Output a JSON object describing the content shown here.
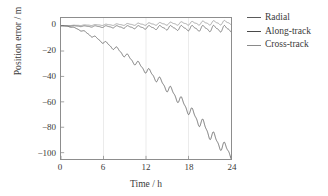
{
  "chart_data": {
    "type": "line",
    "title": "",
    "xlabel": "Time / h",
    "ylabel": "Position error / m",
    "xlim": [
      0,
      24
    ],
    "ylim": [
      -105,
      6
    ],
    "xticks": [
      0,
      6,
      12,
      18,
      24
    ],
    "yticks": [
      0,
      -20,
      -40,
      -60,
      -80,
      -100
    ],
    "xtick_labels": [
      "0",
      "6",
      "12",
      "18",
      "24"
    ],
    "ytick_labels": [
      "0",
      "−20",
      "−40",
      "−60",
      "−80",
      "−100"
    ],
    "grid": "vertical-faint",
    "legend_position": "right-outside",
    "series": [
      {
        "name": "Radial",
        "color": "#5a5a5a",
        "description": "near-zero oscillation with slowly growing amplitude, period about 1.5 h, amplitude growing from 0 to about 3 m",
        "x": [
          0,
          1,
          2,
          3,
          4,
          5,
          6,
          7,
          8,
          9,
          10,
          11,
          12,
          13,
          14,
          15,
          16,
          17,
          18,
          19,
          20,
          21,
          22,
          23,
          24
        ],
        "values": [
          0,
          -0.2,
          -0.3,
          -0.5,
          -0.6,
          -0.7,
          -0.8,
          -0.9,
          -1.0,
          -1.1,
          -1.2,
          -1.3,
          -1.4,
          -1.5,
          -1.6,
          -1.7,
          -1.8,
          -1.9,
          -2.0,
          -2.1,
          -2.2,
          -2.3,
          -2.4,
          -2.5,
          -2.6
        ]
      },
      {
        "name": "Along-track",
        "color": "#4a4a4a",
        "description": "large negative drift with superimposed sawtooth oscillation, reaching about -100 m at 24 h",
        "x": [
          0,
          1,
          2,
          3,
          4,
          5,
          6,
          7,
          8,
          9,
          10,
          11,
          12,
          13,
          14,
          15,
          16,
          17,
          18,
          19,
          20,
          21,
          22,
          23,
          24
        ],
        "values": [
          0,
          -0.5,
          -2,
          -4,
          -7,
          -10,
          -13,
          -16,
          -19,
          -23,
          -27,
          -31,
          -35,
          -39,
          -44,
          -49,
          -54,
          -60,
          -66,
          -72,
          -78,
          -85,
          -91,
          -96,
          -100
        ]
      },
      {
        "name": "Cross-track",
        "color": "#8a8a8a",
        "description": "near-zero oscillation, amplitude growing to about 4 m by 24 h",
        "x": [
          0,
          1,
          2,
          3,
          4,
          5,
          6,
          7,
          8,
          9,
          10,
          11,
          12,
          13,
          14,
          15,
          16,
          17,
          18,
          19,
          20,
          21,
          22,
          23,
          24
        ],
        "values": [
          0,
          0.1,
          0.2,
          0.3,
          0.4,
          0.5,
          0.6,
          0.7,
          0.8,
          0.9,
          1.0,
          1.1,
          1.2,
          1.3,
          1.4,
          1.5,
          1.6,
          1.7,
          1.8,
          1.9,
          2.0,
          2.1,
          2.2,
          2.3,
          2.4
        ]
      }
    ]
  },
  "legend": {
    "items": [
      {
        "label": "Radial",
        "color": "#5a5a5a"
      },
      {
        "label": "Along-track",
        "color": "#4a4a4a"
      },
      {
        "label": "Cross-track",
        "color": "#8a8a8a"
      }
    ]
  },
  "axes": {
    "x_title": "Time / h",
    "y_title": "Position error / m"
  }
}
